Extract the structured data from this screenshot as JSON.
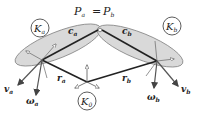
{
  "title": {
    "lhs": "P",
    "lhs_sub": "a",
    "eq": "=",
    "rhs": "P",
    "rhs_sub": "b"
  },
  "frames": {
    "a": {
      "symbol": "K",
      "sub": "a"
    },
    "b": {
      "symbol": "K",
      "sub": "b"
    },
    "base": {
      "symbol": "K",
      "sub": "0"
    }
  },
  "vectors": {
    "c_a": {
      "symbol": "c",
      "sub": "a"
    },
    "c_b": {
      "symbol": "c",
      "sub": "b"
    },
    "r_a": {
      "symbol": "r",
      "sub": "a"
    },
    "r_b": {
      "symbol": "r",
      "sub": "b"
    },
    "v_a": {
      "symbol": "v",
      "sub": "a"
    },
    "v_b": {
      "symbol": "v",
      "sub": "b"
    },
    "w_a": {
      "symbol": "ω",
      "sub": "a"
    },
    "w_b": {
      "symbol": "ω",
      "sub": "b"
    }
  },
  "colors": {
    "ellipse_fill": "#d9d9d9",
    "ellipse_stroke": "#888888",
    "line": "#222222"
  }
}
